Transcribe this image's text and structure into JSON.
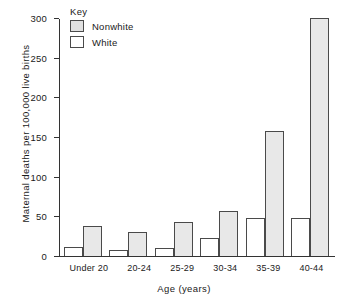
{
  "chart_data": {
    "type": "bar",
    "title": "",
    "xlabel": "Age  (years)",
    "ylabel": "Maternal deaths per 100,000 live births",
    "categories": [
      "Under 20",
      "20-24",
      "25-29",
      "30-34",
      "35-39",
      "40-44"
    ],
    "series": [
      {
        "name": "White",
        "values": [
          11,
          8,
          10,
          23,
          48,
          48
        ]
      },
      {
        "name": "Nonwhite",
        "values": [
          38,
          30,
          43,
          57,
          157,
          300
        ]
      }
    ],
    "series_order_in_group": [
      "White",
      "Nonwhite"
    ],
    "ylim": [
      0,
      300
    ],
    "yticks": [
      0,
      50,
      100,
      150,
      200,
      250,
      300
    ],
    "ytick_labels": [
      "0",
      "50",
      "100",
      "150",
      "200",
      "250",
      "300"
    ],
    "grid": false,
    "legend": {
      "title": "Key",
      "position": "top-left-inside",
      "entries": [
        {
          "label": "Nonwhite",
          "color": "#e8e8e8"
        },
        {
          "label": "White",
          "color": "#ffffff"
        }
      ]
    },
    "colors": {
      "nonwhite_fill": "#e8e8e8",
      "white_fill": "#ffffff",
      "bar_outline": "#4a4a4a",
      "axis": "#333333",
      "text": "#1a1a1a"
    }
  }
}
